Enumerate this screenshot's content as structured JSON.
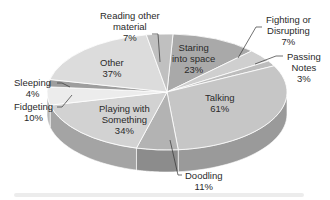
{
  "chart_data": {
    "type": "pie",
    "style": "3d-pie",
    "title": "",
    "note": "Percentages sum to 197% (multiple responses)",
    "slices": [
      {
        "label": "Staring into space",
        "lines": [
          "Staring",
          "into space"
        ],
        "value": 23,
        "pct": "23%",
        "color": "#a9a9a9"
      },
      {
        "label": "Fighting or Disrupting",
        "lines": [
          "Fighting or",
          "Disrupting"
        ],
        "value": 7,
        "pct": "7%",
        "color": "#cfcfcf"
      },
      {
        "label": "Passing Notes",
        "lines": [
          "Passing",
          "Notes"
        ],
        "value": 3,
        "pct": "3%",
        "color": "#bdbdbd"
      },
      {
        "label": "Talking",
        "lines": [
          "Talking"
        ],
        "value": 61,
        "pct": "61%",
        "color": "#c6c6c6"
      },
      {
        "label": "Doodling",
        "lines": [
          "Doodling"
        ],
        "value": 11,
        "pct": "11%",
        "color": "#b3b3b3"
      },
      {
        "label": "Playing with Something",
        "lines": [
          "Playing with",
          "Something"
        ],
        "value": 34,
        "pct": "34%",
        "color": "#d2d2d2"
      },
      {
        "label": "Fidgeting",
        "lines": [
          "Fidgeting"
        ],
        "value": 10,
        "pct": "10%",
        "color": "#ececec"
      },
      {
        "label": "Sleeping",
        "lines": [
          "Sleeping"
        ],
        "value": 4,
        "pct": "4%",
        "color": "#9e9e9e"
      },
      {
        "label": "Other",
        "lines": [
          "Other"
        ],
        "value": 37,
        "pct": "37%",
        "color": "#dcdcdc"
      },
      {
        "label": "Reading other material",
        "lines": [
          "Reading other",
          "material"
        ],
        "value": 7,
        "pct": "7%",
        "color": "#c0c0c0"
      }
    ]
  },
  "labels": {
    "staring": {
      "l1": "Staring",
      "l2": "into space",
      "pct": "23%"
    },
    "fighting": {
      "l1": "Fighting or",
      "l2": "Disrupting",
      "pct": "7%"
    },
    "passing": {
      "l1": "Passing",
      "l2": "Notes",
      "pct": "3%"
    },
    "talking": {
      "l1": "Talking",
      "pct": "61%"
    },
    "doodling": {
      "l1": "Doodling",
      "pct": "11%"
    },
    "playing": {
      "l1": "Playing with",
      "l2": "Something",
      "pct": "34%"
    },
    "fidgeting": {
      "l1": "Fidgeting",
      "pct": "10%"
    },
    "sleeping": {
      "l1": "Sleeping",
      "pct": "4%"
    },
    "other": {
      "l1": "Other",
      "pct": "37%"
    },
    "reading": {
      "l1": "Reading other",
      "l2": "material",
      "pct": "7%"
    }
  }
}
